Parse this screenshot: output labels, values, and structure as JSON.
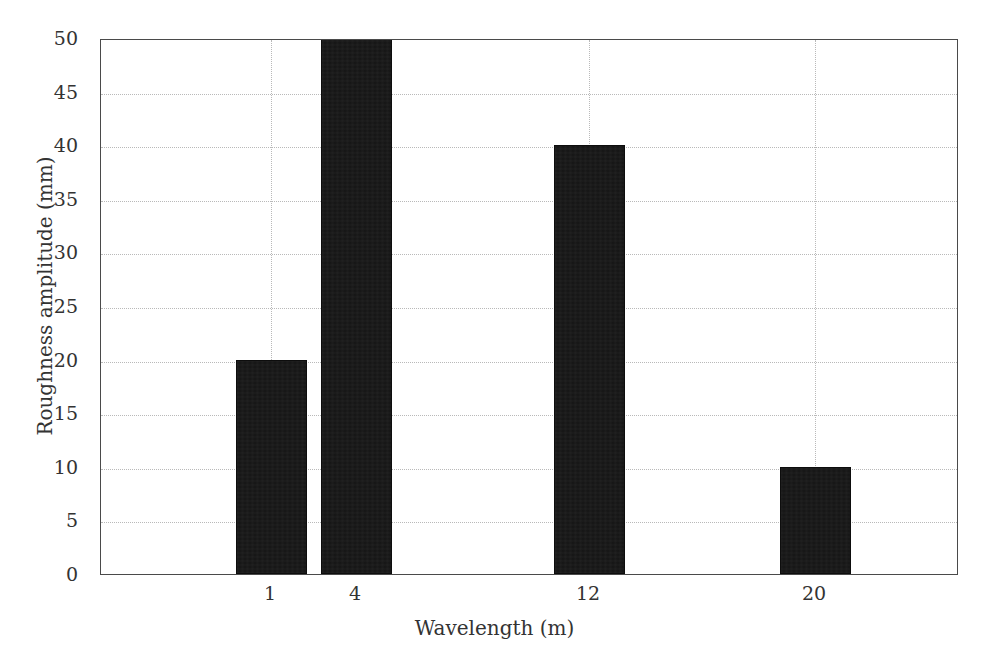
{
  "chart_data": {
    "type": "bar",
    "title": "",
    "xlabel": "Wavelength (m)",
    "ylabel": "Roughness amplitude (mm)",
    "categories": [
      "1",
      "4",
      "12",
      "20"
    ],
    "values": [
      20,
      50,
      40,
      10
    ],
    "value_notes": [
      "top at 20 gridline",
      "bar clipped at plot top, value >= 50",
      "top at 40 gridline",
      "top at 10 gridline"
    ],
    "ylim": [
      0,
      50
    ],
    "ytick_labels": [
      "0",
      "5",
      "10",
      "15",
      "20",
      "25",
      "30",
      "35",
      "40",
      "45",
      "50"
    ],
    "ytick_values": [
      0,
      5,
      10,
      15,
      20,
      25,
      30,
      35,
      40,
      45,
      50
    ],
    "xtick_labels": [
      "1",
      "4",
      "12",
      "20"
    ],
    "grid": true,
    "grid_style": "dotted",
    "legend": null,
    "bar_color": "#141414",
    "grid_color": "#b9b9b9",
    "axis_color": "#4a4a4a",
    "background_color": "#ffffff"
  }
}
